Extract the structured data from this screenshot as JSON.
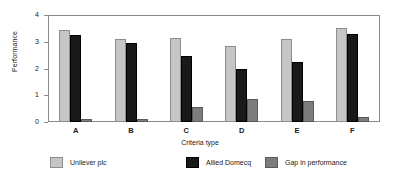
{
  "chart_data": {
    "type": "bar",
    "title": "",
    "xlabel": "Criteria type",
    "ylabel": "Performance",
    "categories": [
      "A",
      "B",
      "C",
      "D",
      "E",
      "F"
    ],
    "ylim": [
      0,
      4
    ],
    "yticks": [
      0,
      1,
      2,
      3,
      4
    ],
    "grid": false,
    "legend_position": "bottom",
    "series": [
      {
        "name": "Unilever plc",
        "color": "#c6c6c6",
        "values": [
          3.45,
          3.1,
          3.15,
          2.85,
          3.1,
          3.5
        ]
      },
      {
        "name": "Allied Domecq",
        "color": "#191919",
        "values": [
          3.25,
          2.95,
          2.45,
          2.0,
          2.25,
          3.3
        ]
      },
      {
        "name": "Gap in performance",
        "color": "#7d7d7d",
        "values": [
          0.1,
          0.1,
          0.55,
          0.85,
          0.8,
          0.2
        ]
      }
    ]
  },
  "axes": {
    "y_title": "Performance",
    "x_title": "Criteria type",
    "y_tick_labels": [
      "0",
      "1",
      "2",
      "3",
      "4"
    ],
    "x_tick_labels": [
      "A",
      "B",
      "C",
      "D",
      "E",
      "F"
    ]
  },
  "legend": {
    "items": [
      {
        "label": "Unilever plc",
        "swatch": "light-gray-swatch"
      },
      {
        "label": "Allied Domecq",
        "swatch": "black-swatch"
      },
      {
        "label": "Gap in performance",
        "swatch": "medium-gray-swatch"
      }
    ]
  }
}
